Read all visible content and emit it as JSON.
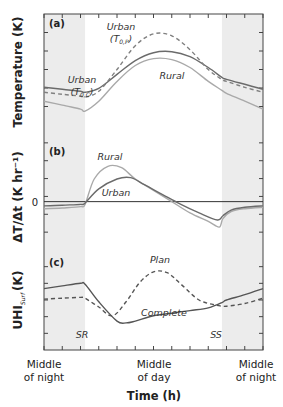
{
  "chart_data": {
    "type": "line",
    "xlabel": "Time (h)",
    "xlim": [
      0,
      24
    ],
    "x_categories": [
      {
        "x": 0,
        "label_line1": "Middle",
        "label_line2": "of night"
      },
      {
        "x": 12,
        "label_line1": "Middle",
        "label_line2": "of day"
      },
      {
        "x": 24,
        "label_line1": "Middle",
        "label_line2": "of night"
      }
    ],
    "x_minor_ticks_every_h": 2,
    "shaded_night": [
      [
        0,
        4.5
      ],
      [
        19.5,
        24
      ]
    ],
    "sunrise": {
      "x": 4.5,
      "label": "SR"
    },
    "sunset": {
      "x": 19.5,
      "label": "SS"
    },
    "panels": [
      {
        "tag": "(a)",
        "ylabel": "Temperature (K)",
        "ylim": [
          0,
          10
        ],
        "series": [
          {
            "name": "Urban (T0,C)",
            "label_main": "Urban",
            "label_sym": "T",
            "label_sub": "0,C",
            "style": "solid",
            "color": "#6b6b6b",
            "x": [
              0,
              2,
              4,
              4.5,
              6,
              8,
              10,
              12,
              14,
              16,
              18,
              19.5,
              20,
              22,
              24
            ],
            "y": [
              3.2,
              3.0,
              2.8,
              2.7,
              3.1,
              4.5,
              5.9,
              6.7,
              6.8,
              6.3,
              5.2,
              4.2,
              4.0,
              3.5,
              3.0
            ]
          },
          {
            "name": "Urban (T0,P)",
            "label_main": "Urban",
            "label_sym": "T",
            "label_sub": "0,P",
            "style": "dashed",
            "color": "#808080",
            "x": [
              0,
              2,
              4,
              4.5,
              6,
              8,
              10,
              12,
              14,
              16,
              18,
              19.5,
              20,
              22,
              24
            ],
            "y": [
              2.7,
              2.5,
              2.3,
              2.2,
              2.8,
              5.0,
              7.4,
              8.6,
              8.4,
              7.0,
              5.0,
              4.0,
              3.8,
              3.2,
              2.7
            ]
          },
          {
            "name": "Rural",
            "label_main": "Rural",
            "style": "solid",
            "color": "#a9a9a9",
            "x": [
              0,
              2,
              4,
              4.5,
              6,
              8,
              10,
              12,
              14,
              16,
              18,
              19.5,
              20,
              22,
              24
            ],
            "y": [
              1.8,
              1.4,
              1.0,
              0.8,
              1.8,
              3.8,
              5.4,
              6.1,
              6.0,
              5.2,
              3.8,
              2.9,
              2.6,
              1.8,
              1.0
            ]
          }
        ]
      },
      {
        "tag": "(b)",
        "ylabel": "ΔT/Δt (K hr⁻¹)",
        "zero_label": "0",
        "ylim": [
          -3,
          5
        ],
        "series": [
          {
            "name": "Rural",
            "label_main": "Rural",
            "style": "solid",
            "color": "#a9a9a9",
            "x": [
              0,
              2,
              4,
              4.5,
              5.5,
              7,
              8.5,
              10,
              12,
              14,
              16,
              18,
              19.2,
              19.6,
              20.5,
              22,
              24
            ],
            "y": [
              -0.5,
              -0.45,
              -0.35,
              -0.2,
              1.6,
              2.5,
              2.4,
              1.6,
              0.8,
              0.0,
              -0.8,
              -1.4,
              -1.8,
              -1.2,
              -0.7,
              -0.5,
              -0.4
            ]
          },
          {
            "name": "Urban",
            "label_main": "Urban",
            "style": "solid",
            "color": "#6b6b6b",
            "x": [
              0,
              2,
              4,
              4.5,
              6,
              8,
              9.5,
              11,
              13,
              15,
              17,
              19,
              19.6,
              20.5,
              22,
              24
            ],
            "y": [
              -0.3,
              -0.25,
              -0.2,
              -0.1,
              0.9,
              1.6,
              1.7,
              1.2,
              0.5,
              -0.2,
              -0.8,
              -1.3,
              -1.0,
              -0.6,
              -0.4,
              -0.3
            ]
          }
        ]
      },
      {
        "tag": "(c)",
        "ylabel": "UHI_Surf (K)",
        "ylabel_main": "UHI",
        "ylabel_sub": "Surf",
        "ylabel_unit": "(K)",
        "ylim": [
          0,
          10
        ],
        "series": [
          {
            "name": "Complete",
            "label_main": "Complete",
            "style": "solid",
            "color": "#555555",
            "x": [
              0,
              2,
              4,
              4.5,
              6,
              8,
              9,
              10,
              12,
              14,
              16,
              18,
              19.5,
              20,
              22,
              24
            ],
            "y": [
              6.3,
              6.6,
              6.9,
              6.8,
              4.8,
              2.6,
              2.4,
              2.6,
              3.2,
              3.5,
              3.8,
              4.1,
              4.7,
              5.0,
              5.6,
              6.3
            ]
          },
          {
            "name": "Plan",
            "label_main": "Plan",
            "style": "dashed",
            "color": "#555555",
            "x": [
              0,
              2,
              4,
              4.5,
              6,
              7.5,
              9,
              10.5,
              12,
              13.5,
              15,
              17,
              19,
              20,
              22,
              24
            ],
            "y": [
              5.1,
              5.2,
              5.3,
              5.2,
              4.2,
              3.2,
              4.8,
              7.0,
              8.2,
              8.1,
              6.8,
              5.0,
              4.4,
              4.3,
              4.6,
              5.2
            ]
          }
        ]
      }
    ]
  }
}
